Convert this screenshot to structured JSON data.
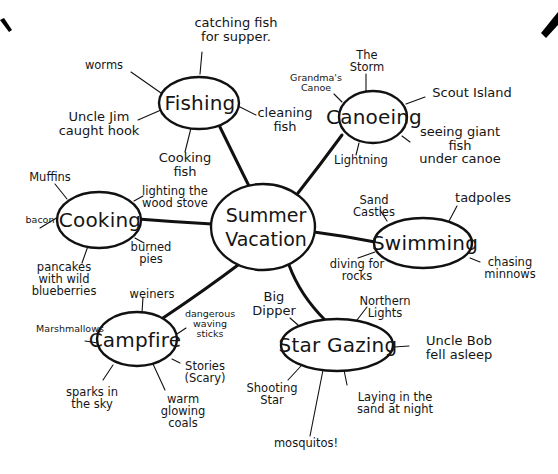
{
  "center": {
    "label": "Summer\nVacation"
  },
  "nodes": {
    "fishing": {
      "label": "Fishing",
      "leaves": [
        "catching fish\nfor supper.",
        "worms",
        "Uncle Jim\ncaught hook",
        "cleaning\nfish",
        "Cooking\nfish"
      ]
    },
    "canoeing": {
      "label": "Canoeing",
      "leaves": [
        "The\nStorm",
        "Grandma's\nCanoe",
        "Scout Island",
        "seeing giant fish\nunder canoe",
        "Lightning"
      ]
    },
    "cooking": {
      "label": "Cooking",
      "leaves": [
        "Muffins",
        "lighting the\nwood stove",
        "bacon",
        "burned\npies",
        "pancakes\nwith wild\nblueberries"
      ]
    },
    "swimming": {
      "label": "Swimming",
      "leaves": [
        "Sand\nCastles",
        "tadpoles",
        "diving for\nrocks",
        "chasing\nminnows"
      ]
    },
    "campfire": {
      "label": "Campfire",
      "leaves": [
        "weiners",
        "Marshmallows",
        "dangerous\nwaving\nsticks",
        "Stories\n(Scary)",
        "sparks in\nthe sky",
        "warm\nglowing\ncoals"
      ]
    },
    "stargazing": {
      "label": "Star Gazing",
      "leaves": [
        "Big\nDipper",
        "Northern\nLights",
        "Uncle Bob\nfell asleep",
        "Shooting\nStar",
        "Laying in the\nsand at night",
        "mosquitos!"
      ]
    }
  }
}
